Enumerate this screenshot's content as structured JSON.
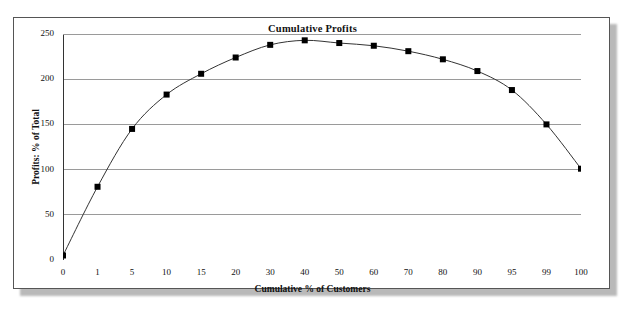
{
  "chart_data": {
    "type": "line",
    "title": "Cumulative Profits",
    "xlabel": "Cumulative % of Customers",
    "ylabel": "Profits: % of Total",
    "categories": [
      "0",
      "1",
      "5",
      "10",
      "15",
      "20",
      "30",
      "40",
      "50",
      "60",
      "70",
      "80",
      "90",
      "95",
      "99",
      "100"
    ],
    "values": [
      5,
      81,
      145,
      183,
      206,
      224,
      238,
      243,
      240,
      237,
      231,
      222,
      209,
      188,
      150,
      101
    ],
    "ylim": [
      0,
      250
    ],
    "y_ticks": [
      "0",
      "50",
      "100",
      "150",
      "200",
      "250"
    ],
    "y_tick_values": [
      0,
      50,
      100,
      150,
      200,
      250
    ],
    "grid": "horizontal",
    "legend": "none",
    "marker": "square",
    "marker_color": "#000000",
    "line_color": "#333333",
    "grid_color": "#9a9a9a",
    "axis_color": "#333333",
    "background": "#ffffff",
    "frame_color": "#555555"
  }
}
